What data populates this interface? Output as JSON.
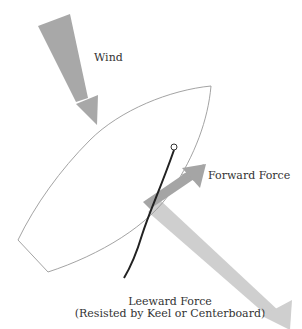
{
  "diagram": {
    "type": "sailing-forces",
    "labels": {
      "wind": "Wind",
      "forward_force": "Forward Force",
      "leeward_force_line1": "Leeward Force",
      "leeward_force_line2": "(Resisted by Keel or Centerboard)"
    },
    "colors": {
      "wind_arrow": "#a8a8a8",
      "forward_arrow": "#a5a5a5",
      "leeward_arrow": "#cfcfcf",
      "hull_outline": "#999999",
      "sail": "#222222",
      "text": "#333333"
    }
  }
}
